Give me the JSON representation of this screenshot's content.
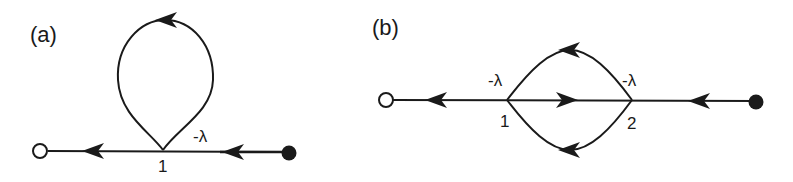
{
  "panels": [
    {
      "label": "(a)",
      "nodes": [
        {
          "id": "source",
          "type": "open-circle"
        },
        {
          "id": "1",
          "label": "1"
        },
        {
          "id": "sink",
          "type": "filled-circle"
        }
      ],
      "edges": [
        {
          "from": "1",
          "to": "source",
          "direction": "left"
        },
        {
          "from": "1",
          "to": "1",
          "type": "self-loop",
          "gain": "-λ"
        },
        {
          "from": "sink",
          "to": "1",
          "direction": "left"
        }
      ],
      "gain_label": "-λ",
      "node_label": "1"
    },
    {
      "label": "(b)",
      "nodes": [
        {
          "id": "source",
          "type": "open-circle"
        },
        {
          "id": "1",
          "label": "1"
        },
        {
          "id": "2",
          "label": "2"
        },
        {
          "id": "sink",
          "type": "filled-circle"
        }
      ],
      "edges": [
        {
          "from": "1",
          "to": "source",
          "direction": "left"
        },
        {
          "from": "1",
          "to": "2",
          "direction": "right"
        },
        {
          "from": "2",
          "to": "1",
          "type": "upper-arc",
          "direction": "left"
        },
        {
          "from": "2",
          "to": "1",
          "type": "lower-arc",
          "direction": "left"
        },
        {
          "from": "sink",
          "to": "2",
          "direction": "left"
        }
      ],
      "gain_label_1": "-λ",
      "gain_label_2": "-λ",
      "node_label_1": "1",
      "node_label_2": "2"
    }
  ],
  "colors": {
    "stroke": "#1a1a1a",
    "background": "#ffffff"
  }
}
